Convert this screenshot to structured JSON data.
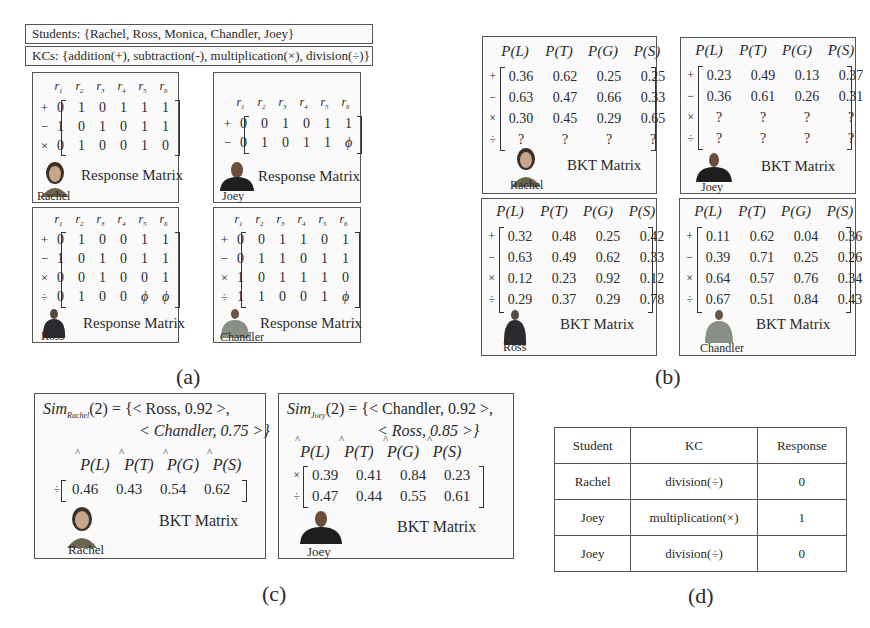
{
  "header": {
    "students_label": "Students: {Rachel, Ross, Monica, Chandler, Joey}",
    "kcs_label": "KCs: {addition(+), subtraction(-), multiplication(×), division(÷)}"
  },
  "panel_a": {
    "caption": "(a)",
    "column_headers": [
      "r",
      "r",
      "r",
      "r",
      "r",
      "r"
    ],
    "column_subscripts": [
      "1",
      "2",
      "3",
      "4",
      "5",
      "6"
    ],
    "matrix_title": "Response Matrix",
    "students": [
      {
        "name": "Rachel",
        "rows": [
          {
            "op": "+",
            "values": [
              "0",
              "1",
              "0",
              "1",
              "1",
              "1"
            ]
          },
          {
            "op": "−",
            "values": [
              "1",
              "0",
              "1",
              "0",
              "1",
              "1"
            ]
          },
          {
            "op": "×",
            "values": [
              "0",
              "1",
              "0",
              "0",
              "1",
              "0"
            ]
          }
        ]
      },
      {
        "name": "Joey",
        "rows": [
          {
            "op": "+",
            "values": [
              "0",
              "0",
              "1",
              "0",
              "1",
              "1"
            ]
          },
          {
            "op": "−",
            "values": [
              "0",
              "1",
              "0",
              "1",
              "1",
              "ϕ"
            ]
          }
        ]
      },
      {
        "name": "Ross",
        "rows": [
          {
            "op": "+",
            "values": [
              "0",
              "1",
              "0",
              "0",
              "1",
              "1"
            ]
          },
          {
            "op": "−",
            "values": [
              "1",
              "0",
              "1",
              "0",
              "1",
              "1"
            ]
          },
          {
            "op": "×",
            "values": [
              "0",
              "0",
              "1",
              "0",
              "0",
              "1"
            ]
          },
          {
            "op": "÷",
            "values": [
              "0",
              "1",
              "0",
              "0",
              "ϕ",
              "ϕ"
            ]
          }
        ]
      },
      {
        "name": "Chandler",
        "rows": [
          {
            "op": "+",
            "values": [
              "0",
              "0",
              "1",
              "1",
              "0",
              "1"
            ]
          },
          {
            "op": "−",
            "values": [
              "0",
              "1",
              "1",
              "0",
              "1",
              "1"
            ]
          },
          {
            "op": "×",
            "values": [
              "1",
              "0",
              "1",
              "1",
              "1",
              "0"
            ]
          },
          {
            "op": "÷",
            "values": [
              "1",
              "1",
              "0",
              "0",
              "1",
              "ϕ"
            ]
          }
        ]
      }
    ]
  },
  "panel_b": {
    "caption": "(b)",
    "column_headers": [
      "P(L)",
      "P(T)",
      "P(G)",
      "P(S)"
    ],
    "matrix_title": "BKT Matrix",
    "students": [
      {
        "name": "Rachel",
        "rows": [
          {
            "op": "+",
            "values": [
              "0.36",
              "0.62",
              "0.25",
              "0.25"
            ]
          },
          {
            "op": "−",
            "values": [
              "0.63",
              "0.47",
              "0.66",
              "0.33"
            ]
          },
          {
            "op": "×",
            "values": [
              "0.30",
              "0.45",
              "0.29",
              "0.65"
            ]
          },
          {
            "op": "÷",
            "values": [
              "?",
              "?",
              "?",
              "?"
            ]
          }
        ]
      },
      {
        "name": "Joey",
        "rows": [
          {
            "op": "+",
            "values": [
              "0.23",
              "0.49",
              "0.13",
              "0.37"
            ]
          },
          {
            "op": "−",
            "values": [
              "0.36",
              "0.61",
              "0.26",
              "0.31"
            ]
          },
          {
            "op": "×",
            "values": [
              "?",
              "?",
              "?",
              "?"
            ]
          },
          {
            "op": "÷",
            "values": [
              "?",
              "?",
              "?",
              "?"
            ]
          }
        ]
      },
      {
        "name": "Ross",
        "rows": [
          {
            "op": "+",
            "values": [
              "0.32",
              "0.48",
              "0.25",
              "0.42"
            ]
          },
          {
            "op": "−",
            "values": [
              "0.63",
              "0.49",
              "0.62",
              "0.33"
            ]
          },
          {
            "op": "×",
            "values": [
              "0.12",
              "0.23",
              "0.92",
              "0.12"
            ]
          },
          {
            "op": "÷",
            "values": [
              "0.29",
              "0.37",
              "0.29",
              "0.78"
            ]
          }
        ]
      },
      {
        "name": "Chandler",
        "rows": [
          {
            "op": "+",
            "values": [
              "0.11",
              "0.62",
              "0.04",
              "0.36"
            ]
          },
          {
            "op": "−",
            "values": [
              "0.39",
              "0.71",
              "0.25",
              "0.26"
            ]
          },
          {
            "op": "×",
            "values": [
              "0.64",
              "0.57",
              "0.76",
              "0.34"
            ]
          },
          {
            "op": "÷",
            "values": [
              "0.67",
              "0.51",
              "0.84",
              "0.43"
            ]
          }
        ]
      }
    ]
  },
  "panel_c": {
    "caption": "(c)",
    "column_headers": [
      "P(L)",
      "P(T)",
      "P(G)",
      "P(S)"
    ],
    "matrix_title": "BKT Matrix",
    "rachel": {
      "name": "Rachel",
      "sim_prefix": "Sim",
      "sim_subscript": "Rachel",
      "sim_line1": "(2) = {< Ross, 0.92 >,",
      "sim_line2": "< Chandler, 0.75 >}",
      "rows": [
        {
          "op": "÷",
          "values": [
            "0.46",
            "0.43",
            "0.54",
            "0.62"
          ]
        }
      ]
    },
    "joey": {
      "name": "Joey",
      "sim_prefix": "Sim",
      "sim_subscript": "Joey",
      "sim_line1": "(2) = {< Chandler, 0.92 >,",
      "sim_line2": "< Ross, 0.85 >}",
      "rows": [
        {
          "op": "×",
          "values": [
            "0.39",
            "0.41",
            "0.84",
            "0.23"
          ]
        },
        {
          "op": "÷",
          "values": [
            "0.47",
            "0.44",
            "0.55",
            "0.61"
          ]
        }
      ]
    }
  },
  "panel_d": {
    "caption": "(d)",
    "headers": [
      "Student",
      "KC",
      "Response"
    ],
    "rows": [
      [
        "Rachel",
        "division(÷)",
        "0"
      ],
      [
        "Joey",
        "multiplication(×)",
        "1"
      ],
      [
        "Joey",
        "division(÷)",
        "0"
      ]
    ]
  }
}
